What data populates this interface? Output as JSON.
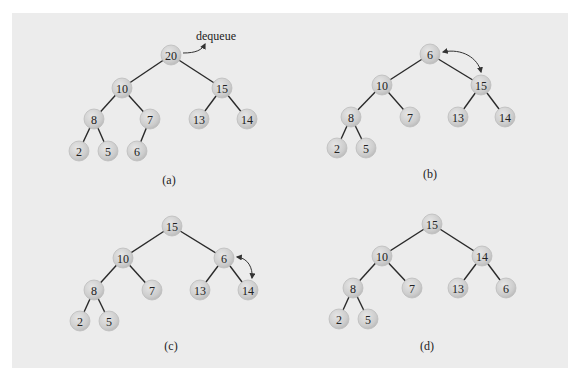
{
  "figure": {
    "background_color": "#ececec",
    "node_color": "#cfcfcf",
    "edge_color": "#2a2a2a",
    "panels": [
      {
        "id": "a",
        "caption": "(a)",
        "annotation": "dequeue",
        "nodes": [
          {
            "value": "20",
            "x": 171,
            "y": 55
          },
          {
            "value": "10",
            "x": 122,
            "y": 88
          },
          {
            "value": "15",
            "x": 222,
            "y": 88
          },
          {
            "value": "8",
            "x": 94,
            "y": 119
          },
          {
            "value": "7",
            "x": 150,
            "y": 119
          },
          {
            "value": "13",
            "x": 199,
            "y": 119
          },
          {
            "value": "14",
            "x": 247,
            "y": 119
          },
          {
            "value": "2",
            "x": 79,
            "y": 151
          },
          {
            "value": "5",
            "x": 108,
            "y": 151
          },
          {
            "value": "6",
            "x": 137,
            "y": 151
          }
        ],
        "edges": [
          [
            0,
            1
          ],
          [
            0,
            2
          ],
          [
            1,
            3
          ],
          [
            1,
            4
          ],
          [
            2,
            5
          ],
          [
            2,
            6
          ],
          [
            3,
            7
          ],
          [
            3,
            8
          ],
          [
            4,
            9
          ]
        ],
        "caption_pos": {
          "x": 169,
          "y": 180
        }
      },
      {
        "id": "b",
        "caption": "(b)",
        "annotation": "swap 6 and 15",
        "nodes": [
          {
            "value": "6",
            "x": 430,
            "y": 54
          },
          {
            "value": "10",
            "x": 382,
            "y": 85
          },
          {
            "value": "15",
            "x": 481,
            "y": 85
          },
          {
            "value": "8",
            "x": 351,
            "y": 117
          },
          {
            "value": "7",
            "x": 410,
            "y": 117
          },
          {
            "value": "13",
            "x": 458,
            "y": 117
          },
          {
            "value": "14",
            "x": 505,
            "y": 117
          },
          {
            "value": "2",
            "x": 337,
            "y": 148
          },
          {
            "value": "5",
            "x": 366,
            "y": 148
          }
        ],
        "edges": [
          [
            0,
            1
          ],
          [
            0,
            2
          ],
          [
            1,
            3
          ],
          [
            1,
            4
          ],
          [
            2,
            5
          ],
          [
            2,
            6
          ],
          [
            3,
            7
          ],
          [
            3,
            8
          ]
        ],
        "caption_pos": {
          "x": 430,
          "y": 174
        }
      },
      {
        "id": "c",
        "caption": "(c)",
        "annotation": "swap 6 and 14",
        "nodes": [
          {
            "value": "15",
            "x": 172,
            "y": 226
          },
          {
            "value": "10",
            "x": 123,
            "y": 258
          },
          {
            "value": "6",
            "x": 224,
            "y": 258
          },
          {
            "value": "8",
            "x": 94,
            "y": 290
          },
          {
            "value": "7",
            "x": 152,
            "y": 290
          },
          {
            "value": "13",
            "x": 200,
            "y": 290
          },
          {
            "value": "14",
            "x": 248,
            "y": 290
          },
          {
            "value": "2",
            "x": 80,
            "y": 321
          },
          {
            "value": "5",
            "x": 109,
            "y": 321
          }
        ],
        "edges": [
          [
            0,
            1
          ],
          [
            0,
            2
          ],
          [
            1,
            3
          ],
          [
            1,
            4
          ],
          [
            2,
            5
          ],
          [
            2,
            6
          ],
          [
            3,
            7
          ],
          [
            3,
            8
          ]
        ],
        "caption_pos": {
          "x": 171,
          "y": 346
        }
      },
      {
        "id": "d",
        "caption": "(d)",
        "nodes": [
          {
            "value": "15",
            "x": 432,
            "y": 224
          },
          {
            "value": "10",
            "x": 382,
            "y": 256
          },
          {
            "value": "14",
            "x": 482,
            "y": 256
          },
          {
            "value": "8",
            "x": 353,
            "y": 288
          },
          {
            "value": "7",
            "x": 412,
            "y": 288
          },
          {
            "value": "13",
            "x": 458,
            "y": 288
          },
          {
            "value": "6",
            "x": 506,
            "y": 288
          },
          {
            "value": "2",
            "x": 339,
            "y": 319
          },
          {
            "value": "5",
            "x": 368,
            "y": 319
          }
        ],
        "edges": [
          [
            0,
            1
          ],
          [
            0,
            2
          ],
          [
            1,
            3
          ],
          [
            1,
            4
          ],
          [
            2,
            5
          ],
          [
            2,
            6
          ],
          [
            3,
            7
          ],
          [
            3,
            8
          ]
        ],
        "caption_pos": {
          "x": 427,
          "y": 346
        }
      }
    ]
  }
}
